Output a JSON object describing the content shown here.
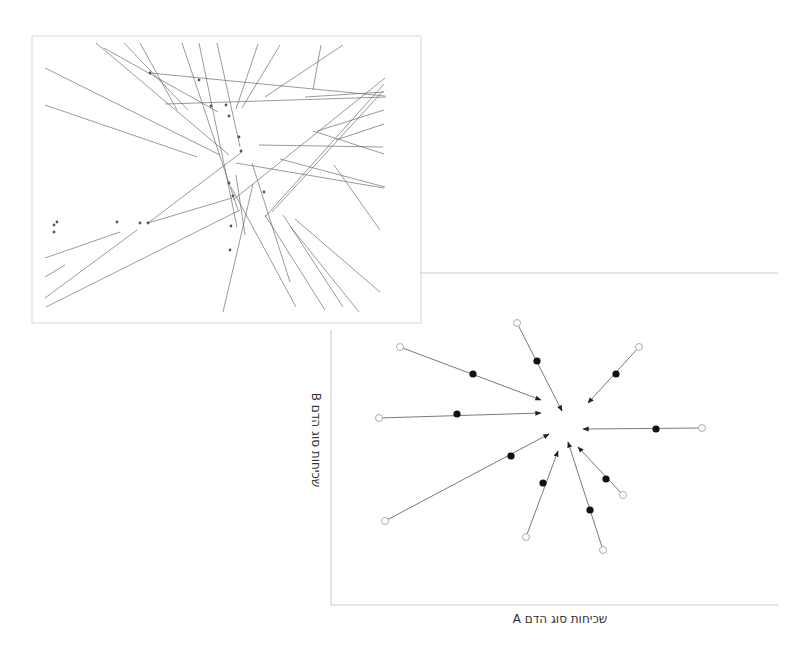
{
  "diagram": {
    "network_panel": {
      "box": {
        "x": 32,
        "y": 36,
        "w": 389,
        "h": 287
      },
      "border_color": "#d8d8d8",
      "line_color": "#6a6a6a",
      "lines": [
        [
          96,
          43,
          229,
          155
        ],
        [
          104,
          48,
          218,
          112
        ],
        [
          124,
          43,
          188,
          110
        ],
        [
          140,
          43,
          177,
          110
        ],
        [
          45,
          68,
          220,
          155
        ],
        [
          45,
          105,
          197,
          157
        ],
        [
          182,
          43,
          238,
          210
        ],
        [
          199,
          43,
          237,
          227
        ],
        [
          217,
          43,
          240,
          147
        ],
        [
          258,
          44,
          236,
          109
        ],
        [
          280,
          45,
          242,
          108
        ],
        [
          321,
          45,
          313,
          90
        ],
        [
          343,
          45,
          265,
          97
        ],
        [
          150,
          73,
          385,
          96
        ],
        [
          165,
          104,
          386,
          97
        ],
        [
          305,
          97,
          384,
          92
        ],
        [
          233,
          200,
          385,
          78
        ],
        [
          265,
          217,
          384,
          84
        ],
        [
          272,
          212,
          383,
          91
        ],
        [
          317,
          131,
          384,
          110
        ],
        [
          313,
          131,
          384,
          154
        ],
        [
          236,
          163,
          384,
          188
        ],
        [
          280,
          159,
          385,
          187
        ],
        [
          334,
          165,
          380,
          230
        ],
        [
          259,
          145,
          383,
          147
        ],
        [
          336,
          140,
          384,
          124
        ],
        [
          148,
          223,
          242,
          152
        ],
        [
          148,
          223,
          232,
          198
        ],
        [
          46,
          307,
          240,
          210
        ],
        [
          45,
          298,
          137,
          230
        ],
        [
          45,
          277,
          65,
          265
        ],
        [
          45,
          258,
          120,
          232
        ],
        [
          223,
          312,
          253,
          184
        ],
        [
          295,
          219,
          380,
          292
        ],
        [
          290,
          226,
          359,
          312
        ],
        [
          283,
          215,
          343,
          307
        ],
        [
          265,
          215,
          325,
          310
        ],
        [
          231,
          187,
          296,
          307
        ],
        [
          252,
          163,
          290,
          282
        ],
        [
          245,
          235,
          236,
          175
        ]
      ],
      "dots": [
        [
          150,
          73
        ],
        [
          199,
          80
        ],
        [
          229,
          116
        ],
        [
          241,
          151
        ],
        [
          229,
          183
        ],
        [
          231,
          226
        ],
        [
          233,
          196
        ],
        [
          148,
          223
        ],
        [
          117,
          222
        ],
        [
          140,
          223
        ],
        [
          54,
          225
        ],
        [
          54,
          232
        ],
        [
          264,
          192
        ],
        [
          226,
          105
        ],
        [
          239,
          137
        ],
        [
          211,
          106
        ],
        [
          230,
          250
        ],
        [
          57,
          222
        ]
      ]
    },
    "chart": {
      "axis_color": "#c8c8c8",
      "top_rule": {
        "x1": 420,
        "y1": 273,
        "x2": 778,
        "y2": 273
      },
      "x_axis": {
        "x1": 331,
        "y1": 605,
        "x2": 778,
        "y2": 605
      },
      "y_axis": {
        "x1": 331,
        "y1": 330,
        "x2": 331,
        "y2": 605
      },
      "x_label": "שכיחות סוג הדם A",
      "y_label": "שכיחות סוג הדם B",
      "arrow_color": "#6a6a6a",
      "open_marker_color": "#ffffff",
      "filled_marker_color": "#111111"
    }
  },
  "chart_data": {
    "type": "scatter",
    "title": "",
    "xlabel": "שכיחות סוג הדם A",
    "ylabel": "שכיחות סוג הדם B",
    "grid": false,
    "legend": [],
    "series": [
      {
        "name": "trajectory-1",
        "start": [
          400,
          347
        ],
        "mid": [
          473,
          374
        ],
        "end": [
          541,
          400
        ]
      },
      {
        "name": "trajectory-2",
        "start": [
          517,
          323
        ],
        "mid": [
          537,
          361
        ],
        "end": [
          562,
          411
        ]
      },
      {
        "name": "trajectory-3",
        "start": [
          379,
          418
        ],
        "mid": [
          457,
          414
        ],
        "end": [
          541,
          413
        ]
      },
      {
        "name": "trajectory-4",
        "start": [
          639,
          347
        ],
        "mid": [
          616,
          374
        ],
        "end": [
          588,
          403
        ]
      },
      {
        "name": "trajectory-5",
        "start": [
          702,
          428
        ],
        "mid": [
          656,
          429
        ],
        "end": [
          583,
          429
        ]
      },
      {
        "name": "trajectory-6",
        "start": [
          385,
          521
        ],
        "mid": [
          511,
          456
        ],
        "end": [
          549,
          434
        ]
      },
      {
        "name": "trajectory-7",
        "start": [
          526,
          537
        ],
        "mid": [
          543,
          483
        ],
        "end": [
          558,
          451
        ]
      },
      {
        "name": "trajectory-8",
        "start": [
          603,
          550
        ],
        "mid": [
          590,
          510
        ],
        "end": [
          568,
          442
        ]
      },
      {
        "name": "trajectory-9",
        "start": [
          623,
          495
        ],
        "mid": [
          606,
          479
        ],
        "end": [
          578,
          447
        ]
      }
    ],
    "center_estimate": [
      563,
      428
    ]
  }
}
